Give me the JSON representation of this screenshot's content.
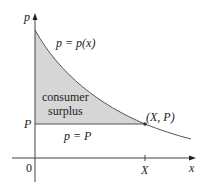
{
  "diagram": {
    "title": "Consumer surplus",
    "axes": {
      "y_label": "p",
      "x_label": "x",
      "origin_label": "0"
    },
    "labels": {
      "demand_curve": "p = p(x)",
      "price_line": "p = P",
      "region": [
        "consumer",
        "surplus"
      ],
      "point": "(X, P)",
      "price_tick": "P",
      "quantity_tick": "X"
    },
    "colors": {
      "shaded_region": "#d6d6d6",
      "curve": "#555555",
      "axes": "#444444"
    }
  }
}
